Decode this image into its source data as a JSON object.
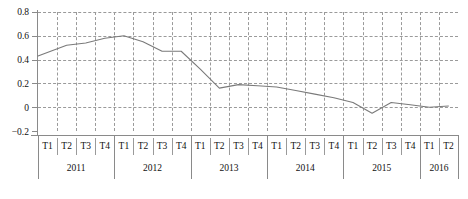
{
  "chart_data": {
    "type": "line",
    "title": "",
    "subtitle": "",
    "xlabel": "",
    "ylabel": "",
    "grid": true,
    "legend": "none",
    "ylim": [
      -0.2,
      0.8
    ],
    "yticks": [
      0.8,
      0.6,
      0.4,
      0.2,
      0,
      -0.2
    ],
    "ytick_labels": [
      "0.8",
      "0.6",
      "0.4",
      "0.2",
      "0",
      "−0.2"
    ],
    "quarters": [
      "T1",
      "T2",
      "T3",
      "T4",
      "T1",
      "T2",
      "T3",
      "T4",
      "T1",
      "T2",
      "T3",
      "T4",
      "T1",
      "T2",
      "T3",
      "T4",
      "T1",
      "T2",
      "T3",
      "T4",
      "T1",
      "T2"
    ],
    "years": [
      {
        "label": "2011",
        "quarters": 4
      },
      {
        "label": "2012",
        "quarters": 4
      },
      {
        "label": "2013",
        "quarters": 4
      },
      {
        "label": "2014",
        "quarters": 4
      },
      {
        "label": "2015",
        "quarters": 4
      },
      {
        "label": "2016",
        "quarters": 2
      }
    ],
    "categories": [
      "2011 T1",
      "2011 T2",
      "2011 T3",
      "2011 T4",
      "2012 T1",
      "2012 T2",
      "2012 T3",
      "2012 T4",
      "2013 T1",
      "2013 T2",
      "2013 T3",
      "2013 T4",
      "2014 T1",
      "2014 T2",
      "2014 T3",
      "2014 T4",
      "2015 T1",
      "2015 T2",
      "2015 T3",
      "2015 T4",
      "2016 T1",
      "2016 T2"
    ],
    "series": [
      {
        "name": "series-1",
        "color": "#7a7a7a",
        "values": [
          0.43,
          0.52,
          0.54,
          0.58,
          0.6,
          0.55,
          0.47,
          0.47,
          0.32,
          0.16,
          0.19,
          0.18,
          0.17,
          0.14,
          0.11,
          0.08,
          0.04,
          -0.05,
          0.04,
          0.02,
          0.0,
          0.01
        ]
      }
    ]
  },
  "colors": {
    "line": "#7a7a7a",
    "grid": "#9a9a9a",
    "axis": "#8a8a8a",
    "text": "#111111",
    "background": "#ffffff"
  }
}
